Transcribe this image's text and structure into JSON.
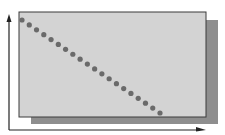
{
  "diagram": {
    "type": "scatter-illustration",
    "colors": {
      "background": "#ffffff",
      "panel": "#d3d3d3",
      "panel_border": "#3a3a3a",
      "shadow": "#8e8e8e",
      "dots": "#6a6a6a",
      "axes": "#222222"
    },
    "panel": {
      "x": 19,
      "y": 12,
      "w": 187,
      "h": 105
    },
    "shadow": {
      "x": 31,
      "y": 20,
      "w": 187,
      "h": 104
    },
    "axes": {
      "origin": {
        "x": 9,
        "y": 130
      },
      "y_end": 14,
      "x_end": 206
    },
    "dots": {
      "count": 20,
      "start": {
        "x": 22,
        "y": 20
      },
      "end": {
        "x": 160,
        "y": 113
      },
      "radius": 2.6
    }
  },
  "chart_data": {
    "type": "scatter",
    "title": "",
    "xlabel": "",
    "ylabel": "",
    "x": [
      0,
      1,
      2,
      3,
      4,
      5,
      6,
      7,
      8,
      9,
      10,
      11,
      12,
      13,
      14,
      15,
      16,
      17,
      18,
      19
    ],
    "y": [
      19,
      18,
      17,
      16,
      15,
      14,
      13,
      12,
      11,
      10,
      9,
      8,
      7,
      6,
      5,
      4,
      3,
      2,
      1,
      0
    ],
    "grid": false,
    "legend": null
  }
}
